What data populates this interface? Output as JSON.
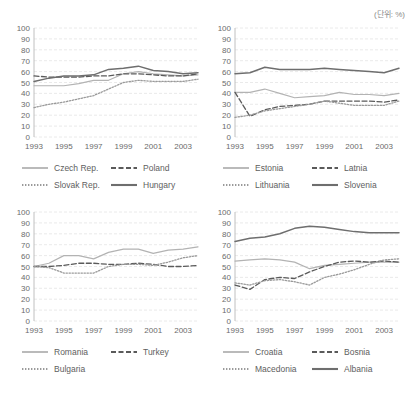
{
  "unit_note": "(단위: %)",
  "axis": {
    "y_ticks": [
      0,
      10,
      20,
      30,
      40,
      50,
      60,
      70,
      80,
      90,
      100
    ],
    "x_tick_labels": [
      "1993",
      "1995",
      "1997",
      "1999",
      "2001",
      "2003"
    ],
    "x_years_all": [
      1993,
      1994,
      1995,
      1996,
      1997,
      1998,
      1999,
      2000,
      2001,
      2002,
      2003,
      2004
    ],
    "ylim": [
      0,
      100
    ],
    "xlim": [
      1993,
      2004
    ]
  },
  "chart_data": [
    {
      "id": "central-europe",
      "type": "line",
      "title": "",
      "xlabel": "",
      "ylabel": "",
      "ylim": [
        0,
        100
      ],
      "grid": true,
      "legend_position": "bottom",
      "x": [
        1993,
        1994,
        1995,
        1996,
        1997,
        1998,
        1999,
        2000,
        2001,
        2002,
        2003,
        2004
      ],
      "series": [
        {
          "name": "Czech Rep.",
          "style": "solid-light",
          "values": [
            47,
            47,
            47,
            49,
            52,
            52,
            58,
            60,
            58,
            57,
            56,
            57
          ]
        },
        {
          "name": "Poland",
          "style": "dashed",
          "values": [
            56,
            55,
            55,
            55,
            56,
            56,
            58,
            58,
            57,
            56,
            56,
            58
          ]
        },
        {
          "name": "Slovak Rep.",
          "style": "dotted",
          "values": [
            27,
            30,
            32,
            35,
            38,
            44,
            50,
            52,
            51,
            51,
            51,
            53
          ]
        },
        {
          "name": "Hungary",
          "style": "solid-dark",
          "values": [
            51,
            54,
            56,
            56,
            57,
            62,
            63,
            65,
            61,
            60,
            58,
            59
          ]
        }
      ]
    },
    {
      "id": "baltics-slovenia",
      "type": "line",
      "title": "",
      "xlabel": "",
      "ylabel": "",
      "ylim": [
        0,
        100
      ],
      "grid": true,
      "legend_position": "bottom",
      "x": [
        1993,
        1994,
        1995,
        1996,
        1997,
        1998,
        1999,
        2000,
        2001,
        2002,
        2003,
        2004
      ],
      "series": [
        {
          "name": "Estonia",
          "style": "solid-light",
          "values": [
            41,
            41,
            44,
            40,
            36,
            37,
            38,
            41,
            39,
            39,
            38,
            40
          ]
        },
        {
          "name": "Latnia",
          "style": "dashed",
          "values": [
            41,
            19,
            25,
            28,
            29,
            30,
            33,
            33,
            33,
            33,
            32,
            34
          ]
        },
        {
          "name": "Lithuania",
          "style": "dotted",
          "values": [
            18,
            20,
            24,
            26,
            28,
            30,
            33,
            31,
            29,
            29,
            29,
            33
          ]
        },
        {
          "name": "Slovenia",
          "style": "solid-dark",
          "values": [
            58,
            59,
            64,
            62,
            62,
            62,
            63,
            62,
            61,
            60,
            59,
            63
          ]
        }
      ]
    },
    {
      "id": "romania-turkey-bulgaria",
      "type": "line",
      "title": "",
      "xlabel": "",
      "ylabel": "",
      "ylim": [
        0,
        100
      ],
      "grid": true,
      "legend_position": "bottom",
      "x": [
        1993,
        1994,
        1995,
        1996,
        1997,
        1998,
        1999,
        2000,
        2001,
        2002,
        2003,
        2004
      ],
      "series": [
        {
          "name": "Romania",
          "style": "solid-light",
          "values": [
            50,
            53,
            60,
            60,
            57,
            63,
            66,
            66,
            62,
            65,
            66,
            68
          ]
        },
        {
          "name": "Turkey",
          "style": "dashed",
          "values": [
            50,
            50,
            51,
            53,
            53,
            52,
            52,
            53,
            52,
            50,
            50,
            51
          ]
        },
        {
          "name": "Bulgaria",
          "style": "dotted",
          "values": [
            50,
            49,
            44,
            44,
            44,
            50,
            52,
            52,
            51,
            54,
            58,
            60
          ]
        }
      ]
    },
    {
      "id": "balkans",
      "type": "line",
      "title": "",
      "xlabel": "",
      "ylabel": "",
      "ylim": [
        0,
        100
      ],
      "grid": true,
      "legend_position": "bottom",
      "x": [
        1993,
        1994,
        1995,
        1996,
        1997,
        1998,
        1999,
        2000,
        2001,
        2002,
        2003,
        2004
      ],
      "series": [
        {
          "name": "Croatia",
          "style": "solid-light",
          "values": [
            55,
            56,
            57,
            56,
            54,
            48,
            51,
            52,
            53,
            54,
            54,
            54
          ]
        },
        {
          "name": "Bosnia",
          "style": "dashed",
          "values": [
            33,
            29,
            38,
            40,
            39,
            45,
            50,
            54,
            55,
            54,
            55,
            54
          ]
        },
        {
          "name": "Macedonia",
          "style": "dotted",
          "values": [
            35,
            33,
            37,
            38,
            36,
            33,
            40,
            43,
            47,
            52,
            56,
            57
          ]
        },
        {
          "name": "Albania",
          "style": "solid-dark",
          "values": [
            73,
            76,
            77,
            80,
            85,
            87,
            86,
            84,
            82,
            81,
            81,
            81
          ]
        }
      ]
    }
  ],
  "legends": [
    {
      "items": [
        {
          "label": "Czech Rep.",
          "style": "solid-light"
        },
        {
          "label": "Poland",
          "style": "dashed"
        },
        {
          "label": "Slovak Rep.",
          "style": "dotted"
        },
        {
          "label": "Hungary",
          "style": "solid-dark"
        }
      ]
    },
    {
      "items": [
        {
          "label": "Estonia",
          "style": "solid-light"
        },
        {
          "label": "Latnia",
          "style": "dashed"
        },
        {
          "label": "Lithuania",
          "style": "dotted"
        },
        {
          "label": "Slovenia",
          "style": "solid-dark"
        }
      ]
    },
    {
      "items": [
        {
          "label": "Romania",
          "style": "solid-light"
        },
        {
          "label": "Turkey",
          "style": "dashed"
        },
        {
          "label": "Bulgaria",
          "style": "dotted"
        }
      ]
    },
    {
      "items": [
        {
          "label": "Croatia",
          "style": "solid-light"
        },
        {
          "label": "Bosnia",
          "style": "dashed"
        },
        {
          "label": "Macedonia",
          "style": "dotted"
        },
        {
          "label": "Albania",
          "style": "solid-dark"
        }
      ]
    }
  ],
  "colors": {
    "solid_light": "#b3b3b3",
    "solid_dark": "#6e6e6e",
    "dashed": "#5a5a5a",
    "dotted": "#9a9a9a",
    "grid": "#e4e4e4",
    "text": "#6b6b6b"
  }
}
